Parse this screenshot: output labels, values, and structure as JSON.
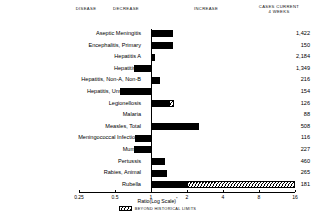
{
  "header": {
    "disease": "DISEASE",
    "decrease": "DECREASE",
    "increase": "INCREASE",
    "cases_line1": "CASES CURRENT",
    "cases_line2": "4 WEEKS"
  },
  "axis": {
    "title": "Ratio(Log Scale)",
    "title_marker": "*",
    "ticks": [
      "0.25",
      "0.5",
      "1",
      "2",
      "4",
      "8",
      "16"
    ]
  },
  "legend": {
    "label": "BEYOND HISTORICAL LIMITS",
    "swatch": "hatched-pattern"
  },
  "colors": {
    "bar": "#000000",
    "background": "#ffffff",
    "axis": "#000000"
  },
  "chart_data": {
    "type": "bar",
    "title": "",
    "xlabel": "Ratio(Log Scale)",
    "ylabel": "DISEASE",
    "xscale": "log",
    "xlim": [
      0.25,
      16
    ],
    "xticks": [
      0.25,
      0.5,
      1,
      2,
      4,
      8,
      16
    ],
    "grid": false,
    "legend_position": "bottom",
    "baseline": 1,
    "orientation": "horizontal",
    "categories": [
      "Aseptic Meningitis",
      "Encephalitis, Primary",
      "Hepatitis A",
      "Hepatitis B",
      "Hepatitis, Non-A, Non-B",
      "Hepatitis, Unspecified",
      "Legionellosis",
      "Malaria",
      "Measles, Total",
      "Meningococcal Infections",
      "Mumps",
      "Pertussis",
      "Rabies, Animal",
      "Rubella"
    ],
    "values": [
      1.52,
      1.52,
      1.08,
      0.72,
      1.18,
      0.55,
      1.55,
      1.0,
      2.5,
      0.74,
      0.72,
      1.3,
      1.35,
      16.0
    ],
    "cases_current_4_weeks": [
      "1,422",
      "150",
      "2,184",
      "1,349",
      "216",
      "154",
      "126",
      "88",
      "508",
      "116",
      "227",
      "460",
      "265",
      "181"
    ],
    "beyond_historical_limits": [
      false,
      false,
      false,
      false,
      false,
      false,
      true,
      false,
      false,
      false,
      false,
      false,
      false,
      true
    ],
    "series": [
      {
        "name": "Ratio to historical baseline",
        "values": [
          1.52,
          1.52,
          1.08,
          0.72,
          1.18,
          0.55,
          1.55,
          1.0,
          2.5,
          0.74,
          0.72,
          1.3,
          1.35,
          16.0
        ]
      }
    ],
    "rows": [
      {
        "disease": "Aseptic Meningitis",
        "ratio": 1.52,
        "cases": "1,422",
        "beyond": false
      },
      {
        "disease": "Encephalitis, Primary",
        "ratio": 1.52,
        "cases": "150",
        "beyond": false
      },
      {
        "disease": "Hepatitis A",
        "ratio": 1.08,
        "cases": "2,184",
        "beyond": false
      },
      {
        "disease": "Hepatitis B",
        "ratio": 0.72,
        "cases": "1,349",
        "beyond": false
      },
      {
        "disease": "Hepatitis, Non-A, Non-B",
        "ratio": 1.18,
        "cases": "216",
        "beyond": false
      },
      {
        "disease": "Hepatitis, Unspecified",
        "ratio": 0.55,
        "cases": "154",
        "beyond": false
      },
      {
        "disease": "Legionellosis",
        "ratio": 1.55,
        "cases": "126",
        "beyond": true
      },
      {
        "disease": "Malaria",
        "ratio": 1.0,
        "cases": "88",
        "beyond": false
      },
      {
        "disease": "Measles, Total",
        "ratio": 2.5,
        "cases": "508",
        "beyond": false
      },
      {
        "disease": "Meningococcal Infections",
        "ratio": 0.74,
        "cases": "116",
        "beyond": false
      },
      {
        "disease": "Mumps",
        "ratio": 0.72,
        "cases": "227",
        "beyond": false
      },
      {
        "disease": "Pertussis",
        "ratio": 1.3,
        "cases": "460",
        "beyond": false
      },
      {
        "disease": "Rabies, Animal",
        "ratio": 1.35,
        "cases": "265",
        "beyond": false
      },
      {
        "disease": "Rubella",
        "ratio": 16.0,
        "cases": "181",
        "beyond": true
      }
    ]
  }
}
